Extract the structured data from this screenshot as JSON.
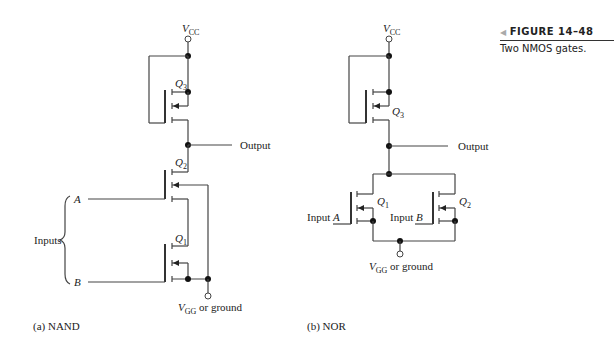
{
  "figure": {
    "number": "FIGURE 14–48",
    "description": "Two NMOS gates."
  },
  "nand": {
    "caption": "(a) NAND",
    "supply_label": "V",
    "supply_sub": "CC",
    "output_label": "Output",
    "inputs_label": "Inputs",
    "input_a": "A",
    "input_b": "B",
    "q3": "Q",
    "q3_sub": "3",
    "q2": "Q",
    "q2_sub": "2",
    "q1": "Q",
    "q1_sub": "1",
    "ground_label_v": "V",
    "ground_label_sub": "GG",
    "ground_label_rest": " or ground"
  },
  "nor": {
    "caption": "(b) NOR",
    "supply_label": "V",
    "supply_sub": "CC",
    "output_label": "Output",
    "input_a_prefix": "Input ",
    "input_a": "A",
    "input_b_prefix": "Input ",
    "input_b": "B",
    "q3": "Q",
    "q3_sub": "3",
    "q1": "Q",
    "q1_sub": "1",
    "q2": "Q",
    "q2_sub": "2",
    "ground_label_v": "V",
    "ground_label_sub": "GG",
    "ground_label_rest": " or ground"
  }
}
